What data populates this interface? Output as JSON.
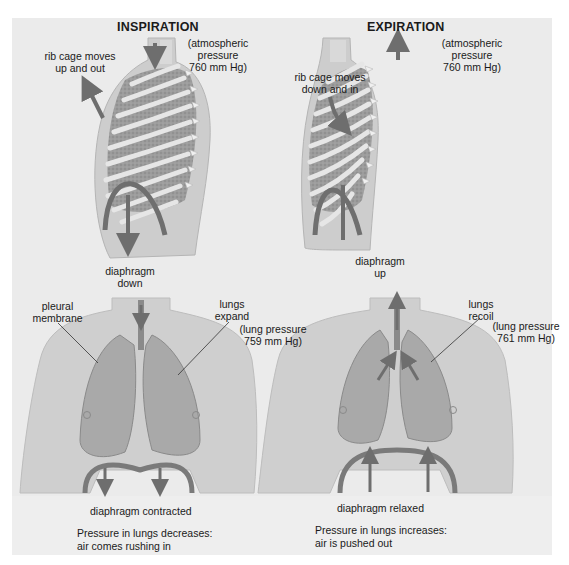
{
  "figure": {
    "left_panel": {
      "title": "INSPIRATION",
      "atmospheric_label": [
        "(atmospheric",
        "pressure",
        "760 mm Hg)"
      ],
      "rib_cage_label": [
        "rib cage moves",
        "up and out"
      ],
      "diaphragm_label": [
        "diaphragm",
        "down"
      ],
      "pleural_label": [
        "pleural",
        "membrane"
      ],
      "lungs_label": [
        "lungs",
        "expand"
      ],
      "lung_pressure_label": [
        "(lung pressure",
        "759 mm Hg)"
      ],
      "diaphragm_state": "diaphragm contracted",
      "summary": [
        "Pressure in lungs decreases:",
        "air comes rushing in"
      ]
    },
    "right_panel": {
      "title": "EXPIRATION",
      "atmospheric_label": [
        "(atmospheric",
        "pressure",
        "760 mm Hg)"
      ],
      "rib_cage_label": [
        "rib cage moves",
        "down and in"
      ],
      "diaphragm_label": [
        "diaphragm",
        "up"
      ],
      "lungs_label": [
        "lungs",
        "recoil"
      ],
      "lung_pressure_label": [
        "(lung pressure",
        "761 mm Hg)"
      ],
      "diaphragm_state": "diaphragm relaxed",
      "summary": [
        "Pressure in lungs increases:",
        "air is pushed out"
      ]
    },
    "colors": {
      "background": "#ebebeb",
      "skin": "#cfcfcf",
      "lung": "#a9a9a9",
      "arrow": "#6e6e6e",
      "rib": "#e4e4e4"
    }
  }
}
